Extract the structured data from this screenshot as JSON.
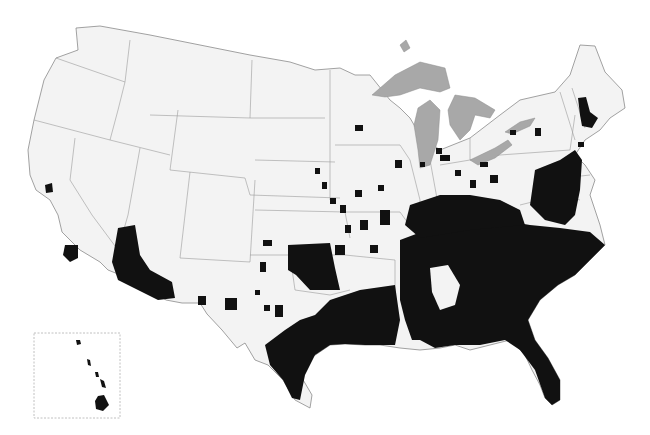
{
  "map": {
    "title": "",
    "region": "Contiguous United States with Hawaii inset",
    "style": "county-level binary choropleth",
    "colors": {
      "background": "#ffffff",
      "land": "#f3f3f3",
      "highlighted_counties": "#111111",
      "state_borders": "#9a9a9a",
      "great_lakes": "#a8a8a8"
    },
    "insets": [
      {
        "name": "Hawaii",
        "position": "bottom-left"
      }
    ],
    "highlighted_regions": [
      "Southeastern states (Mississippi, Alabama, Georgia, South Carolina, Florida, Tennessee)",
      "Louisiana and East/South Texas",
      "Oklahoma (western block)",
      "Southern Arizona and Southern California",
      "Mid-Atlantic corridor (Maryland, Delaware, New Jersey, Virginia)",
      "Kentucky and southern Midwest clusters",
      "New Hampshire / Massachusetts clusters"
    ]
  }
}
